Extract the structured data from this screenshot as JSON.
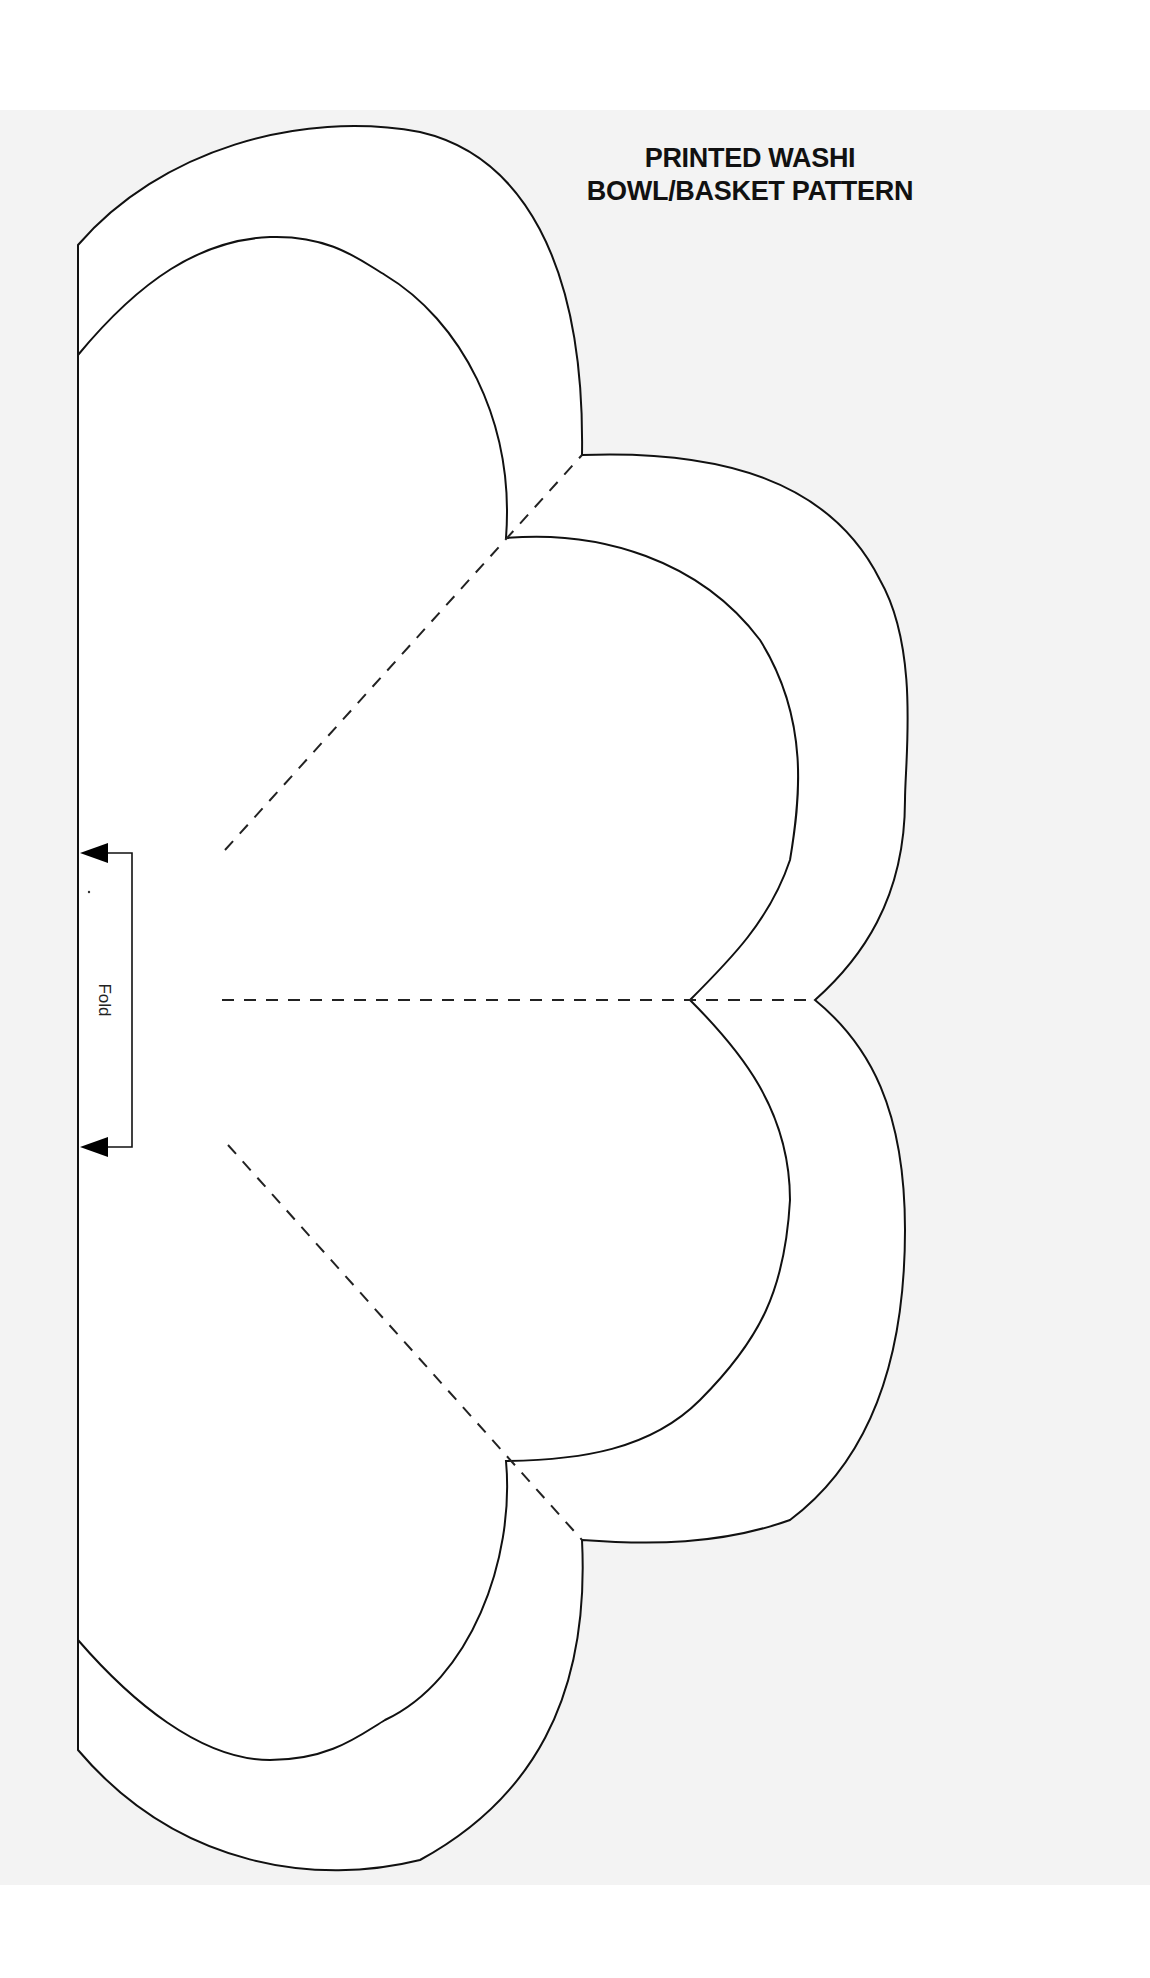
{
  "title": {
    "line1": "PRINTED WASHI",
    "line2": "BOWL/BASKET PATTERN"
  },
  "annotations": {
    "fold_label": "Fold"
  },
  "icons": {
    "fold_arrow_top": "arrow-left-filled",
    "fold_arrow_bottom": "arrow-left-filled"
  },
  "colors": {
    "background": "#ffffff",
    "sheet": "#f3f3f3",
    "pattern_fill": "#ffffff",
    "stroke": "#111111"
  }
}
